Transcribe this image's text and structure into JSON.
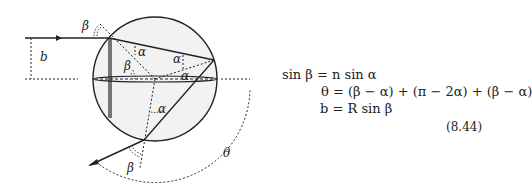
{
  "figure": {
    "labels": {
      "b": "b",
      "beta_entry": "β",
      "beta_inner": "β",
      "alpha_entry": "α",
      "alpha_back_top": "α",
      "alpha_back_bottom": "α",
      "alpha_exit": "α",
      "beta_exit": "β",
      "theta": "θ"
    }
  },
  "equations": {
    "lines": [
      "sin β = n sin α",
      "θ = (β − α) + (π − 2α) + (β − α)",
      "b = R sin β"
    ],
    "number": "(8.44)"
  }
}
